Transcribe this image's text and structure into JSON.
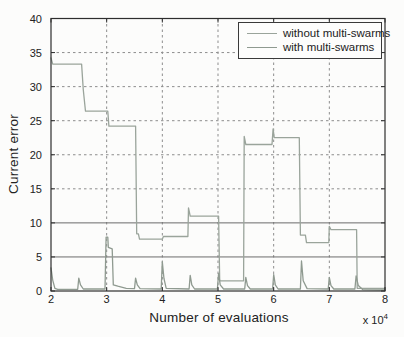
{
  "chart_data": {
    "type": "line",
    "title": "",
    "xlabel": "Number of evaluations",
    "ylabel": "Current error",
    "x_multiplier": {
      "base": "x 10",
      "exp": "4"
    },
    "xlim": [
      2,
      8
    ],
    "ylim": [
      0,
      40
    ],
    "x_ticks": [
      "2",
      "3",
      "4",
      "5",
      "6",
      "7",
      "8"
    ],
    "x_tick_values": [
      2,
      3,
      4,
      5,
      6,
      7,
      8
    ],
    "y_ticks": [
      "0",
      "5",
      "10",
      "15",
      "20",
      "25",
      "30",
      "35",
      "40"
    ],
    "y_tick_values": [
      0,
      5,
      10,
      15,
      20,
      25,
      30,
      35,
      40
    ],
    "grid": {
      "x_dashed": [
        3,
        4,
        5,
        6,
        7
      ],
      "y_dashed": [
        15,
        20,
        25,
        30,
        35
      ],
      "y_solid": [
        5,
        10
      ]
    },
    "legend": {
      "position": "top-right"
    },
    "axis_color": "#2e2e2e",
    "series": [
      {
        "name": "without multi-swarms",
        "color": "#9aa49b",
        "points": [
          [
            2.0,
            34.2
          ],
          [
            2.03,
            33.3
          ],
          [
            2.55,
            33.3
          ],
          [
            2.58,
            29.5
          ],
          [
            2.62,
            26.4
          ],
          [
            3.02,
            26.4
          ],
          [
            3.04,
            24.2
          ],
          [
            3.52,
            24.2
          ],
          [
            3.54,
            8.4
          ],
          [
            3.57,
            8.4
          ],
          [
            3.59,
            7.6
          ],
          [
            4.0,
            7.6
          ],
          [
            4.02,
            8.0
          ],
          [
            4.46,
            8.0
          ],
          [
            4.47,
            12.2
          ],
          [
            4.5,
            11.0
          ],
          [
            5.01,
            11.0
          ],
          [
            5.03,
            1.5
          ],
          [
            5.46,
            1.5
          ],
          [
            5.47,
            22.7
          ],
          [
            5.5,
            21.5
          ],
          [
            5.97,
            21.5
          ],
          [
            5.99,
            23.8
          ],
          [
            6.01,
            22.5
          ],
          [
            6.46,
            22.5
          ],
          [
            6.48,
            8.2
          ],
          [
            6.57,
            8.2
          ],
          [
            6.59,
            7.1
          ],
          [
            6.99,
            7.1
          ],
          [
            7.0,
            9.5
          ],
          [
            7.03,
            9.0
          ],
          [
            7.49,
            9.0
          ],
          [
            7.5,
            0.4
          ],
          [
            8.0,
            0.4
          ]
        ]
      },
      {
        "name": "with multi-swarms",
        "color": "#8f9a90",
        "points": [
          [
            2.0,
            3.4
          ],
          [
            2.03,
            1.6
          ],
          [
            2.07,
            0.4
          ],
          [
            2.12,
            0.25
          ],
          [
            2.48,
            0.25
          ],
          [
            2.5,
            1.9
          ],
          [
            2.53,
            0.9
          ],
          [
            2.58,
            0.3
          ],
          [
            2.97,
            0.3
          ],
          [
            2.99,
            7.9
          ],
          [
            3.02,
            7.9
          ],
          [
            3.03,
            6.4
          ],
          [
            3.1,
            6.2
          ],
          [
            3.12,
            0.9
          ],
          [
            3.2,
            0.7
          ],
          [
            3.35,
            0.4
          ],
          [
            3.5,
            0.35
          ],
          [
            3.52,
            1.9
          ],
          [
            3.55,
            0.9
          ],
          [
            3.6,
            0.35
          ],
          [
            3.98,
            0.3
          ],
          [
            4.0,
            4.3
          ],
          [
            4.03,
            1.8
          ],
          [
            4.07,
            0.4
          ],
          [
            4.48,
            0.3
          ],
          [
            4.5,
            2.3
          ],
          [
            4.53,
            0.9
          ],
          [
            4.58,
            0.3
          ],
          [
            4.99,
            0.3
          ],
          [
            5.01,
            2.6
          ],
          [
            5.04,
            0.9
          ],
          [
            5.1,
            0.3
          ],
          [
            5.48,
            0.3
          ],
          [
            5.5,
            2.0
          ],
          [
            5.53,
            0.8
          ],
          [
            5.58,
            0.3
          ],
          [
            5.98,
            0.3
          ],
          [
            6.0,
            2.4
          ],
          [
            6.03,
            0.9
          ],
          [
            6.08,
            0.3
          ],
          [
            6.48,
            0.3
          ],
          [
            6.5,
            4.4
          ],
          [
            6.53,
            1.5
          ],
          [
            6.6,
            0.35
          ],
          [
            6.98,
            0.3
          ],
          [
            7.0,
            2.0
          ],
          [
            7.03,
            0.8
          ],
          [
            7.08,
            0.3
          ],
          [
            7.46,
            0.3
          ],
          [
            7.48,
            2.2
          ],
          [
            7.52,
            0.8
          ],
          [
            7.6,
            0.2
          ],
          [
            8.0,
            0.15
          ]
        ]
      }
    ]
  }
}
